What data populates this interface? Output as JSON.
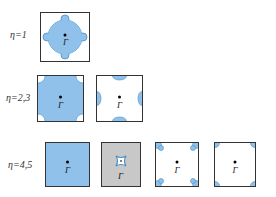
{
  "diagram": {
    "title": "",
    "colors": {
      "fill_blue": "#8fc1ea",
      "edge_blue": "#4a90c8",
      "gray": "#c8c8c8",
      "border": "#333333"
    },
    "rows": [
      {
        "label": "η=1",
        "panels": [
          "star-center"
        ]
      },
      {
        "label": "η=2,3",
        "panels": [
          "filled-with-corner-holes",
          "edge-midpoint-pockets"
        ]
      },
      {
        "label": "η=4,5",
        "panels": [
          "filled",
          "gray-with-small-star",
          "corner-lobes",
          "corner-pockets"
        ]
      }
    ],
    "gamma_label": "Γ"
  }
}
